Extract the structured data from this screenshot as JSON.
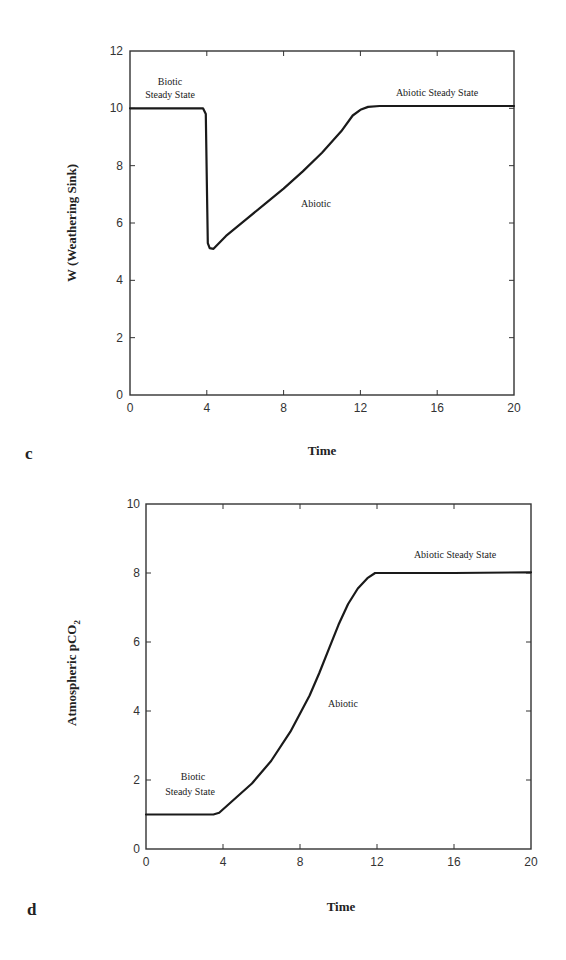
{
  "chart_data": [
    {
      "panel": "c",
      "type": "line",
      "title": "",
      "xlabel": "Time",
      "ylabel": "W  (Weathering Sink)",
      "xlim": [
        0,
        20
      ],
      "ylim": [
        0,
        12
      ],
      "xticks": [
        0,
        4,
        8,
        12,
        16,
        20
      ],
      "yticks": [
        0,
        2,
        4,
        6,
        8,
        10,
        12
      ],
      "grid": false,
      "legend": null,
      "annotations": [
        {
          "text": "Biotic",
          "x": 2.1,
          "y": 11.0
        },
        {
          "text": "Steady State",
          "x": 2.1,
          "y": 10.45
        },
        {
          "text": "Abiotic",
          "x": 8.9,
          "y": 6.6
        },
        {
          "text": "Abiotic Steady State",
          "x": 16.0,
          "y": 10.5
        }
      ],
      "series": [
        {
          "name": "W",
          "x": [
            0,
            3.8,
            3.95,
            4.0,
            4.05,
            4.15,
            4.35,
            5,
            6,
            7,
            8,
            9,
            10,
            11,
            11.6,
            12,
            12.4,
            13,
            16,
            20
          ],
          "y": [
            10.0,
            10.0,
            9.8,
            7.5,
            5.3,
            5.12,
            5.1,
            5.55,
            6.1,
            6.65,
            7.2,
            7.8,
            8.45,
            9.2,
            9.75,
            9.95,
            10.05,
            10.08,
            10.08,
            10.08
          ]
        }
      ]
    },
    {
      "panel": "d",
      "type": "line",
      "title": "",
      "xlabel": "Time",
      "ylabel": "Atmospheric pCO2",
      "xlim": [
        0,
        20
      ],
      "ylim": [
        0,
        10
      ],
      "xticks": [
        0,
        4,
        8,
        12,
        16,
        20
      ],
      "yticks": [
        0,
        2,
        4,
        6,
        8,
        10
      ],
      "grid": false,
      "legend": null,
      "annotations": [
        {
          "text": "Biotic",
          "x": 2.5,
          "y": 2.1
        },
        {
          "text": "Steady  State",
          "x": 2.0,
          "y": 1.6
        },
        {
          "text": "Abiotic",
          "x": 10.3,
          "y": 4.2
        },
        {
          "text": "Abiotic Steady State",
          "x": 16.2,
          "y": 8.5
        }
      ],
      "series": [
        {
          "name": "pCO2",
          "x": [
            0,
            3.5,
            3.8,
            4.5,
            5.5,
            6.5,
            7.5,
            8.5,
            9.0,
            9.5,
            10.0,
            10.5,
            11.0,
            11.5,
            11.9,
            12.5,
            16,
            20
          ],
          "y": [
            1.0,
            1.0,
            1.05,
            1.4,
            1.9,
            2.55,
            3.4,
            4.45,
            5.1,
            5.8,
            6.5,
            7.1,
            7.55,
            7.85,
            8.0,
            8.0,
            8.0,
            8.02
          ]
        }
      ]
    }
  ],
  "panels": {
    "c": {
      "letter": "c",
      "ylabel": "W  (Weathering Sink)",
      "xlabel": "Time",
      "xtick_labels": [
        "0",
        "4",
        "8",
        "12",
        "16",
        "20"
      ],
      "ytick_labels": [
        "0",
        "2",
        "4",
        "6",
        "8",
        "10",
        "12"
      ],
      "annot_biotic_1": "Biotic",
      "annot_biotic_2": "Steady State",
      "annot_abiotic": "Abiotic",
      "annot_abiotic_ss": "Abiotic Steady State"
    },
    "d": {
      "letter": "d",
      "ylabel_main": "Atmospheric pCO",
      "ylabel_sub": "2",
      "xlabel": "Time",
      "xtick_labels": [
        "0",
        "4",
        "8",
        "12",
        "16",
        "20"
      ],
      "ytick_labels": [
        "0",
        "2",
        "4",
        "6",
        "8",
        "10"
      ],
      "annot_biotic_1": "Biotic",
      "annot_biotic_2": "Steady  State",
      "annot_abiotic": "Abiotic",
      "annot_abiotic_ss": "Abiotic Steady State"
    }
  }
}
